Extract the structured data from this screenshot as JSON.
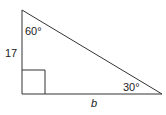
{
  "diagram": {
    "type": "right-triangle",
    "labels": {
      "top_angle": "60°",
      "left_side": "17",
      "bottom_right_angle": "30°",
      "bottom_side": "b"
    },
    "colors": {
      "stroke": "#333333",
      "text": "#222222",
      "background": "#ffffff"
    }
  }
}
